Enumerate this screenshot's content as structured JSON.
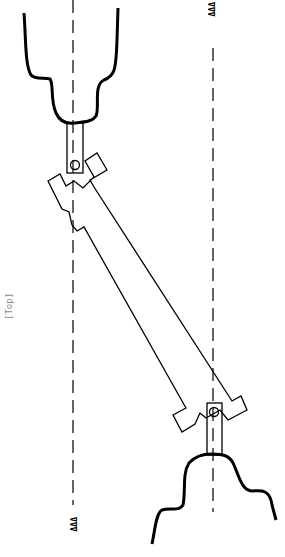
{
  "figure": {
    "view_label": "[Top]",
    "arrow_marks_top": "ΔΔΔ",
    "arrow_marks_bottom": "ΔΔΔ",
    "line_color": "#000000",
    "label_color": "#888888"
  }
}
